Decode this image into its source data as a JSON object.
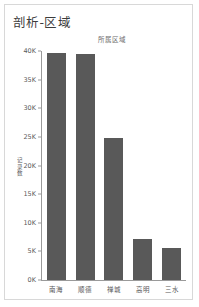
{
  "panel": {
    "title": "剖析-区域",
    "subtitle": "所属区域"
  },
  "chart_data": {
    "type": "bar",
    "title": "剖析-区域",
    "subtitle": "所属区域",
    "xlabel": "所属区域",
    "ylabel": "记录数",
    "categories": [
      "南海",
      "顺德",
      "禅城",
      "高明",
      "三水"
    ],
    "values": [
      39600,
      39500,
      24800,
      7200,
      5600
    ],
    "value_labels": [
      "39.6K",
      "39.5K",
      "24.8K",
      "7.2K",
      "5.6K"
    ],
    "ylim": [
      0,
      40000
    ],
    "yticks": [
      0,
      5000,
      10000,
      15000,
      20000,
      25000,
      30000,
      35000,
      40000
    ],
    "ytick_labels": [
      "0K",
      "5K",
      "10K",
      "15K",
      "20K",
      "25K",
      "30K",
      "35K",
      "40K"
    ],
    "grid": false,
    "legend": false,
    "bar_color": "#595959",
    "axis_color": "#9a9a9a",
    "text_color": "#5a5a5a"
  }
}
